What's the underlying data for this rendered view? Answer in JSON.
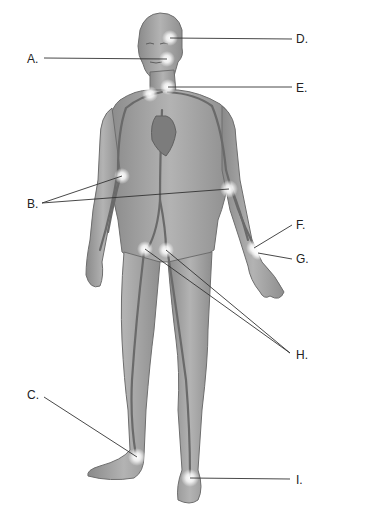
{
  "diagram": {
    "labels": [
      {
        "id": "A",
        "text": "A.",
        "x": 27,
        "y": 53,
        "side": "left",
        "targets": [
          [
            167,
            59
          ]
        ]
      },
      {
        "id": "B",
        "text": "B.",
        "x": 27,
        "y": 198,
        "side": "left",
        "targets": [
          [
            122,
            176
          ],
          [
            229,
            189
          ]
        ]
      },
      {
        "id": "C",
        "text": "C.",
        "x": 27,
        "y": 389,
        "side": "left",
        "targets": [
          [
            137,
            457
          ]
        ]
      },
      {
        "id": "D",
        "text": "D.",
        "x": 296,
        "y": 33,
        "side": "right",
        "targets": [
          [
            170,
            38
          ]
        ]
      },
      {
        "id": "E",
        "text": "E.",
        "x": 296,
        "y": 82,
        "side": "right",
        "targets": [
          [
            168,
            87
          ],
          [
            150,
            94
          ]
        ]
      },
      {
        "id": "F",
        "text": "F.",
        "x": 296,
        "y": 219,
        "side": "right",
        "targets": [
          [
            254,
            248
          ]
        ]
      },
      {
        "id": "G",
        "text": "G.",
        "x": 296,
        "y": 253,
        "side": "right",
        "targets": [
          [
            258,
            253
          ]
        ]
      },
      {
        "id": "H",
        "text": "H.",
        "x": 296,
        "y": 349,
        "side": "right",
        "targets": [
          [
            145,
            249
          ],
          [
            166,
            250
          ]
        ]
      },
      {
        "id": "I",
        "text": "I.",
        "x": 296,
        "y": 474,
        "side": "right",
        "targets": [
          [
            190,
            478
          ]
        ]
      }
    ],
    "colors": {
      "skin": "#9c9c9c",
      "skin_light": "#b8b8b8",
      "outline": "#6e6e6e",
      "vessel": "#6a6a6a",
      "leader": "#333333",
      "glow": "#ffffff",
      "text": "#222222"
    }
  }
}
